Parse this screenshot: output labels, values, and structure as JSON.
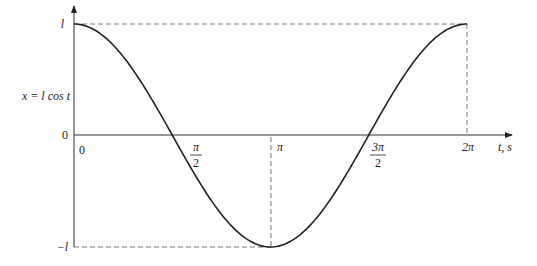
{
  "chart_data": {
    "type": "line",
    "title": "",
    "xlabel": "t, s",
    "ylabel": "x = l cos t",
    "function": "x = l cos t",
    "x_ticks": [
      {
        "value": 0,
        "label": "0"
      },
      {
        "value": 1.5708,
        "label_num": "π",
        "label_den": "2"
      },
      {
        "value": 3.1416,
        "label": "π"
      },
      {
        "value": 4.7124,
        "label_num": "3π",
        "label_den": "2"
      },
      {
        "value": 6.2832,
        "label": "2π"
      }
    ],
    "y_ticks": [
      {
        "value": 1,
        "label": "l"
      },
      {
        "value": 0,
        "label": "0"
      },
      {
        "value": -1,
        "label": "−l"
      }
    ],
    "x": [
      0,
      0.7854,
      1.5708,
      2.3562,
      3.1416,
      3.927,
      4.7124,
      5.4978,
      6.2832
    ],
    "series": [
      {
        "name": "x = l cos t",
        "values": [
          1,
          0.707,
          0,
          -0.707,
          -1,
          -0.707,
          0,
          0.707,
          1
        ]
      }
    ],
    "xlim": [
      0,
      6.2832
    ],
    "ylim": [
      -1,
      1
    ],
    "grid": false,
    "guides": [
      "dashed line at x=l from t=0 to 2π",
      "dashed line at x=−l from t=0 to π",
      "dashed vertical at t=π",
      "dashed vertical at t=2π"
    ],
    "colors": {
      "curve": "#222222",
      "axes": "#333333",
      "guides": "#777777"
    }
  },
  "labels": {
    "ylabel": "x = l cos t",
    "xlabel": "t, s",
    "y_top": "l",
    "y_zero": "0",
    "y_bottom": "−l",
    "x_zero": "0",
    "pi_half_num": "π",
    "pi_half_den": "2",
    "pi": "π",
    "three_pi_half_num": "3π",
    "three_pi_half_den": "2",
    "two_pi": "2π"
  }
}
